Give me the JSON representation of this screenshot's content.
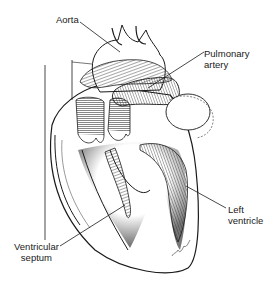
{
  "figure": {
    "background": "#ffffff",
    "ink_color": "#1a1a1a"
  },
  "labels": {
    "aorta": "Aorta",
    "pulmonary_artery_line1": "Pulmonary",
    "pulmonary_artery_line2": "artery",
    "left_ventricle_line1": "Left",
    "left_ventricle_line2": "ventricle",
    "ventricular_septum_line1": "Ventricular",
    "ventricular_septum_line2": "septum"
  }
}
